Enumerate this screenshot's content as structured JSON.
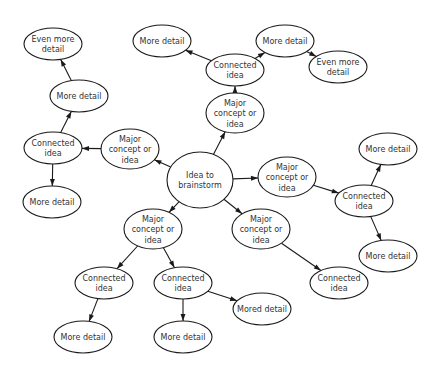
{
  "diagram": {
    "type": "mind-map",
    "colors": {
      "stroke": "#1a1a1a",
      "fill": "#ffffff",
      "text": "#333333"
    },
    "nodes": [
      {
        "id": "root",
        "label": [
          "Idea to",
          "brainstorm"
        ],
        "kind": "root"
      },
      {
        "id": "m_left",
        "label": [
          "Major",
          "concept or",
          "idea"
        ],
        "kind": "major"
      },
      {
        "id": "m_top",
        "label": [
          "Major",
          "concept or",
          "idea"
        ],
        "kind": "major"
      },
      {
        "id": "m_right",
        "label": [
          "Major",
          "concept or",
          "idea"
        ],
        "kind": "major"
      },
      {
        "id": "m_bl",
        "label": [
          "Major",
          "concept or",
          "idea"
        ],
        "kind": "major"
      },
      {
        "id": "m_br",
        "label": [
          "Major",
          "concept or",
          "idea"
        ],
        "kind": "major"
      },
      {
        "id": "c_left",
        "label": [
          "Connected",
          "idea"
        ],
        "kind": "connected"
      },
      {
        "id": "c_top",
        "label": [
          "Connected",
          "idea"
        ],
        "kind": "connected"
      },
      {
        "id": "c_right",
        "label": [
          "Connected",
          "idea"
        ],
        "kind": "connected"
      },
      {
        "id": "c_bl1",
        "label": [
          "Connected",
          "idea"
        ],
        "kind": "connected"
      },
      {
        "id": "c_bl2",
        "label": [
          "Connected",
          "idea"
        ],
        "kind": "connected"
      },
      {
        "id": "c_br",
        "label": [
          "Connected",
          "idea"
        ],
        "kind": "connected"
      },
      {
        "id": "d_left_up",
        "label": [
          "More detail"
        ],
        "kind": "detail"
      },
      {
        "id": "e_left",
        "label": [
          "Even more",
          "detail"
        ],
        "kind": "detail"
      },
      {
        "id": "d_left_down",
        "label": [
          "More detail"
        ],
        "kind": "detail"
      },
      {
        "id": "d_top_l",
        "label": [
          "More detail"
        ],
        "kind": "detail"
      },
      {
        "id": "d_top_r",
        "label": [
          "More detail"
        ],
        "kind": "detail"
      },
      {
        "id": "e_top_r",
        "label": [
          "Even more",
          "detail"
        ],
        "kind": "detail"
      },
      {
        "id": "d_right_up",
        "label": [
          "More detail"
        ],
        "kind": "detail"
      },
      {
        "id": "d_right_down",
        "label": [
          "More detail"
        ],
        "kind": "detail"
      },
      {
        "id": "d_bl1",
        "label": [
          "More detail"
        ],
        "kind": "detail"
      },
      {
        "id": "d_bl2",
        "label": [
          "More detail"
        ],
        "kind": "detail"
      },
      {
        "id": "d_bl2_side",
        "label": [
          "Mored detail"
        ],
        "kind": "detail"
      }
    ],
    "edges": [
      {
        "from": "root",
        "to": "m_left",
        "arrow": true
      },
      {
        "from": "root",
        "to": "m_top",
        "arrow": true
      },
      {
        "from": "root",
        "to": "m_right",
        "arrow": true
      },
      {
        "from": "root",
        "to": "m_bl",
        "arrow": true
      },
      {
        "from": "root",
        "to": "m_br",
        "arrow": true
      },
      {
        "from": "m_left",
        "to": "c_left",
        "arrow": true
      },
      {
        "from": "c_left",
        "to": "d_left_up",
        "arrow": true
      },
      {
        "from": "d_left_up",
        "to": "e_left",
        "arrow": true
      },
      {
        "from": "c_left",
        "to": "d_left_down",
        "arrow": true
      },
      {
        "from": "m_top",
        "to": "c_top",
        "arrow": true
      },
      {
        "from": "c_top",
        "to": "d_top_l",
        "arrow": true
      },
      {
        "from": "c_top",
        "to": "d_top_r",
        "arrow": true
      },
      {
        "from": "d_top_r",
        "to": "e_top_r",
        "arrow": true
      },
      {
        "from": "m_right",
        "to": "c_right",
        "arrow": true
      },
      {
        "from": "c_right",
        "to": "d_right_up",
        "arrow": true
      },
      {
        "from": "c_right",
        "to": "d_right_down",
        "arrow": true
      },
      {
        "from": "m_bl",
        "to": "c_bl1",
        "arrow": true
      },
      {
        "from": "m_bl",
        "to": "c_bl2",
        "arrow": true
      },
      {
        "from": "c_bl1",
        "to": "d_bl1",
        "arrow": true
      },
      {
        "from": "c_bl2",
        "to": "d_bl2",
        "arrow": true
      },
      {
        "from": "c_bl2",
        "to": "d_bl2_side",
        "arrow": true
      },
      {
        "from": "m_br",
        "to": "c_br",
        "arrow": true
      }
    ]
  }
}
